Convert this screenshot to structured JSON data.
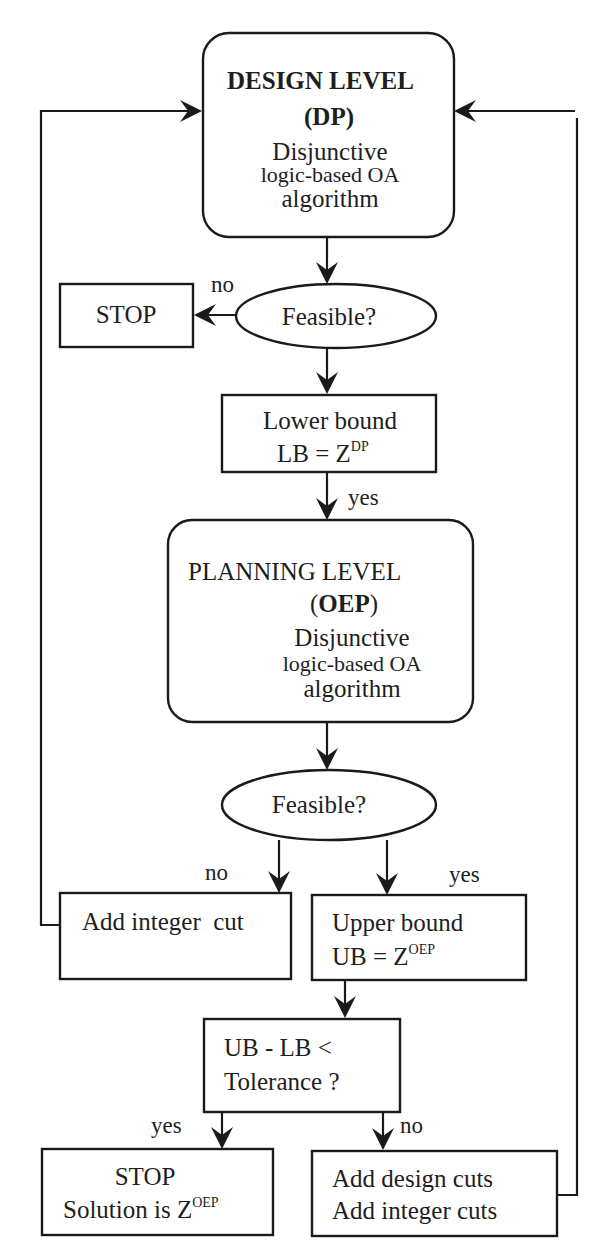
{
  "diagram": {
    "type": "flowchart",
    "colors": {
      "stroke": "#1a1a1a",
      "background": "#ffffff",
      "text": "#1e1e1e"
    },
    "nodes": {
      "design_level": {
        "shape": "rounded-rectangle",
        "title": "DESIGN LEVEL",
        "abbrev": "(DP)",
        "abbrev_core": "DP",
        "line1": "Disjunctive",
        "line2": "logic-based OA",
        "line3": "algorithm"
      },
      "feasible_dp": {
        "shape": "ellipse",
        "label": "Feasible?"
      },
      "stop_infeasible": {
        "shape": "rectangle",
        "label": "STOP"
      },
      "lower_bound": {
        "shape": "rectangle",
        "line1": "Lower bound",
        "line2_prefix": "LB = Z",
        "line2_sup": "DP"
      },
      "planning_level": {
        "shape": "rounded-rectangle",
        "title": "PLANNING LEVEL",
        "abbrev_core": "OEP",
        "line1": "Disjunctive",
        "line2": "logic-based OA",
        "line3": "algorithm"
      },
      "feasible_oep": {
        "shape": "ellipse",
        "label": "Feasible?"
      },
      "add_integer_cut": {
        "shape": "rectangle",
        "label": "Add integer  cut"
      },
      "upper_bound": {
        "shape": "rectangle",
        "line1": "Upper bound",
        "line2_prefix": "UB = Z",
        "line2_sup": "OEP"
      },
      "tolerance_check": {
        "shape": "rectangle",
        "line1": "UB - LB <",
        "line2": "Tolerance ?"
      },
      "stop_solution": {
        "shape": "rectangle",
        "line1": "STOP",
        "line2_prefix": "Solution is Z",
        "line2_sup": "OEP"
      },
      "add_cuts": {
        "shape": "rectangle",
        "line1": "Add design cuts",
        "line2": "Add integer cuts"
      }
    },
    "edge_labels": {
      "dp_infeasible": "no",
      "lb_to_planning": "yes",
      "oep_infeasible": "no",
      "oep_feasible": "yes",
      "tolerance_yes": "yes",
      "tolerance_no": "no"
    },
    "edges": [
      {
        "from": "design_level",
        "to": "feasible_dp"
      },
      {
        "from": "feasible_dp",
        "to": "stop_infeasible",
        "label": "no"
      },
      {
        "from": "feasible_dp",
        "to": "lower_bound"
      },
      {
        "from": "lower_bound",
        "to": "planning_level",
        "label": "yes"
      },
      {
        "from": "planning_level",
        "to": "feasible_oep"
      },
      {
        "from": "feasible_oep",
        "to": "add_integer_cut",
        "label": "no"
      },
      {
        "from": "feasible_oep",
        "to": "upper_bound",
        "label": "yes"
      },
      {
        "from": "add_integer_cut",
        "to": "design_level",
        "route": "left-loop"
      },
      {
        "from": "upper_bound",
        "to": "tolerance_check"
      },
      {
        "from": "tolerance_check",
        "to": "stop_solution",
        "label": "yes"
      },
      {
        "from": "tolerance_check",
        "to": "add_cuts",
        "label": "no"
      },
      {
        "from": "add_cuts",
        "to": "design_level",
        "route": "right-loop"
      }
    ]
  }
}
